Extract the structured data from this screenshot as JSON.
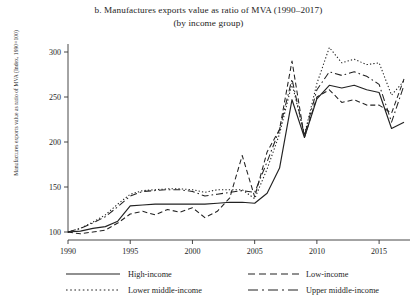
{
  "figure": {
    "title_line1": "b. Manufactures exports value as ratio of MVA (1990–2017)",
    "title_line2": "(by income group)",
    "ylabel": "Manufactures exports value as ratio of MVA (Index, 1990=100)"
  },
  "legend": {
    "entries": [
      {
        "label": "High-income",
        "style": "solid",
        "name": "legend-high-income"
      },
      {
        "label": "Low-income",
        "style": "dashed",
        "name": "legend-low-income"
      },
      {
        "label": "Lower middle-income",
        "style": "dotted",
        "name": "legend-lower-middle-income"
      },
      {
        "label": "Upper middle-income",
        "style": "dashdot",
        "name": "legend-upper-middle-income"
      }
    ]
  },
  "chart_data": {
    "type": "line",
    "title": "b. Manufactures exports value as ratio of MVA (1990–2017) (by income group)",
    "subtitle": "(by income group)",
    "xlabel": "",
    "ylabel": "Manufactures exports value as ratio of MVA (Index, 1990=100)",
    "xlim": [
      1990,
      2017
    ],
    "ylim": [
      90,
      310
    ],
    "yticks": [
      100,
      150,
      200,
      250,
      300
    ],
    "xticks": [
      1990,
      1995,
      2000,
      2005,
      2010,
      2015
    ],
    "grid": false,
    "legend_position": "bottom",
    "x": [
      1990,
      1991,
      1992,
      1993,
      1994,
      1995,
      1996,
      1997,
      1998,
      1999,
      2000,
      2001,
      2002,
      2003,
      2004,
      2005,
      2006,
      2007,
      2008,
      2009,
      2010,
      2011,
      2012,
      2013,
      2014,
      2015,
      2016,
      2017
    ],
    "series": [
      {
        "name": "High-income",
        "style": "solid",
        "color": "#222222",
        "values": [
          100,
          101,
          104,
          106,
          112,
          129,
          130,
          131,
          131,
          131,
          131,
          131,
          132,
          133,
          133,
          132,
          143,
          171,
          247,
          205,
          248,
          263,
          260,
          263,
          258,
          255,
          215,
          222
        ]
      },
      {
        "name": "Low-income",
        "style": "dashed",
        "color": "#222222",
        "values": [
          100,
          98,
          100,
          102,
          110,
          120,
          123,
          119,
          125,
          122,
          127,
          116,
          123,
          138,
          185,
          139,
          189,
          214,
          290,
          205,
          250,
          258,
          244,
          247,
          241,
          241,
          232,
          270
        ]
      },
      {
        "name": "Lower middle-income",
        "style": "dotted",
        "color": "#222222",
        "values": [
          100,
          104,
          111,
          119,
          131,
          142,
          146,
          147,
          148,
          148,
          147,
          144,
          147,
          147,
          147,
          137,
          170,
          209,
          265,
          208,
          265,
          305,
          288,
          292,
          286,
          288,
          252,
          268
        ]
      },
      {
        "name": "Upper middle-income",
        "style": "dashdot",
        "color": "#222222",
        "values": [
          100,
          104,
          110,
          117,
          128,
          140,
          145,
          146,
          147,
          147,
          145,
          140,
          142,
          144,
          146,
          144,
          178,
          214,
          270,
          207,
          258,
          278,
          274,
          278,
          273,
          264,
          222,
          263
        ]
      }
    ]
  }
}
